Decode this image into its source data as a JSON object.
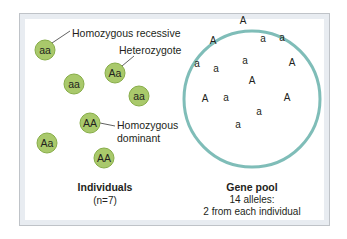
{
  "colors": {
    "individual_fill": "#a9c96b",
    "individual_stroke": "#87ad48",
    "pool_stroke": "#7fbdb8",
    "leader_line": "#3a3a3a"
  },
  "individuals": [
    {
      "genotype": "aa",
      "x": 45,
      "y": 50
    },
    {
      "genotype": "Aa",
      "x": 115,
      "y": 73
    },
    {
      "genotype": "aa",
      "x": 74,
      "y": 84
    },
    {
      "genotype": "aa",
      "x": 139,
      "y": 96
    },
    {
      "genotype": "AA",
      "x": 90,
      "y": 123
    },
    {
      "genotype": "Aa",
      "x": 47,
      "y": 143
    },
    {
      "genotype": "AA",
      "x": 104,
      "y": 158
    }
  ],
  "callouts": {
    "homozygous_recessive": "Homozygous recessive",
    "heterozygote": "Heterozygote",
    "homozygous_dominant_line1": "Homozygous",
    "homozygous_dominant_line2": "dominant"
  },
  "individuals_caption": {
    "title": "Individuals",
    "subtitle": "(n=7)"
  },
  "gene_pool": {
    "alleles": [
      {
        "allele": "A",
        "x": 243,
        "y": 24
      },
      {
        "allele": "A",
        "x": 213,
        "y": 44
      },
      {
        "allele": "a",
        "x": 263,
        "y": 42
      },
      {
        "allele": "a",
        "x": 282,
        "y": 41
      },
      {
        "allele": "a",
        "x": 197,
        "y": 67
      },
      {
        "allele": "a",
        "x": 216,
        "y": 72
      },
      {
        "allele": "a",
        "x": 245,
        "y": 64
      },
      {
        "allele": "A",
        "x": 292,
        "y": 66
      },
      {
        "allele": "A",
        "x": 252,
        "y": 84
      },
      {
        "allele": "A",
        "x": 205,
        "y": 102
      },
      {
        "allele": "a",
        "x": 226,
        "y": 101
      },
      {
        "allele": "A",
        "x": 287,
        "y": 101
      },
      {
        "allele": "a",
        "x": 259,
        "y": 115
      },
      {
        "allele": "a",
        "x": 238,
        "y": 128
      }
    ]
  },
  "gene_pool_caption": {
    "title": "Gene pool",
    "line1": "14 alleles:",
    "line2": "2 from each individual"
  }
}
